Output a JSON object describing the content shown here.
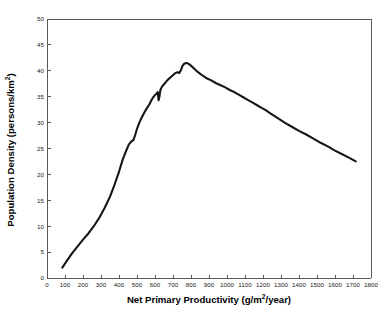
{
  "chart_data": {
    "type": "line",
    "title": "",
    "subtitle": "",
    "xlabel": "Net Primary Productivity (g/m2/year)",
    "xlabel_main": "Net Primary Productivity (g/m",
    "xlabel_sup": "2",
    "xlabel_tail": "/year)",
    "ylabel": "Population Density (persons/km2)",
    "ylabel_main": "Population Density (persons/km",
    "ylabel_sup": "2",
    "ylabel_tail": ")",
    "xlim": [
      0,
      1800
    ],
    "ylim": [
      0,
      50
    ],
    "xticks": [
      0,
      100,
      200,
      300,
      400,
      500,
      600,
      700,
      800,
      900,
      1000,
      1100,
      1200,
      1300,
      1400,
      1500,
      1600,
      1700,
      1800
    ],
    "yticks": [
      0,
      5,
      10,
      15,
      20,
      25,
      30,
      35,
      40,
      45,
      50
    ],
    "grid": false,
    "legend": false,
    "legend_position": "none",
    "line_color": "#161616",
    "axis_color": "#5a5a5a",
    "background_color": "#ffffff",
    "series": [
      {
        "name": "Population density vs NPP",
        "x": [
          85,
          110,
          140,
          170,
          200,
          230,
          260,
          290,
          320,
          350,
          375,
          400,
          420,
          440,
          455,
          470,
          480,
          490,
          500,
          512,
          525,
          540,
          555,
          570,
          580,
          590,
          600,
          608,
          615,
          620,
          625,
          630,
          638,
          648,
          660,
          672,
          685,
          698,
          710,
          722,
          735,
          745,
          752,
          760,
          772,
          785,
          800,
          815,
          830,
          848,
          868,
          890,
          915,
          940,
          965,
          990,
          1015,
          1040,
          1065,
          1090,
          1115,
          1140,
          1165,
          1190,
          1215,
          1245,
          1280,
          1320,
          1360,
          1400,
          1440,
          1480,
          1520,
          1560,
          1600,
          1640,
          1680,
          1715
        ],
        "y": [
          2.0,
          3.3,
          4.8,
          6.1,
          7.4,
          8.6,
          10.0,
          11.6,
          13.5,
          15.7,
          18.0,
          20.5,
          22.8,
          24.6,
          25.8,
          26.4,
          26.6,
          27.6,
          28.8,
          29.9,
          30.9,
          31.9,
          32.8,
          33.6,
          34.3,
          34.9,
          35.3,
          35.6,
          35.9,
          34.3,
          35.1,
          36.3,
          36.9,
          37.3,
          37.8,
          38.3,
          38.7,
          39.1,
          39.5,
          39.7,
          39.6,
          40.2,
          40.9,
          41.3,
          41.5,
          41.4,
          41.0,
          40.5,
          40.0,
          39.5,
          39.0,
          38.5,
          38.1,
          37.6,
          37.2,
          36.8,
          36.3,
          35.9,
          35.4,
          34.9,
          34.4,
          33.9,
          33.4,
          32.9,
          32.4,
          31.7,
          30.9,
          30.0,
          29.2,
          28.4,
          27.7,
          26.9,
          26.1,
          25.4,
          24.6,
          23.9,
          23.2,
          22.5
        ]
      }
    ],
    "annotations": [],
    "peak": {
      "x": 752,
      "y": 41.5
    },
    "start": {
      "x": 85,
      "y": 2.0
    },
    "end": {
      "x": 1715,
      "y": 22.5
    }
  }
}
